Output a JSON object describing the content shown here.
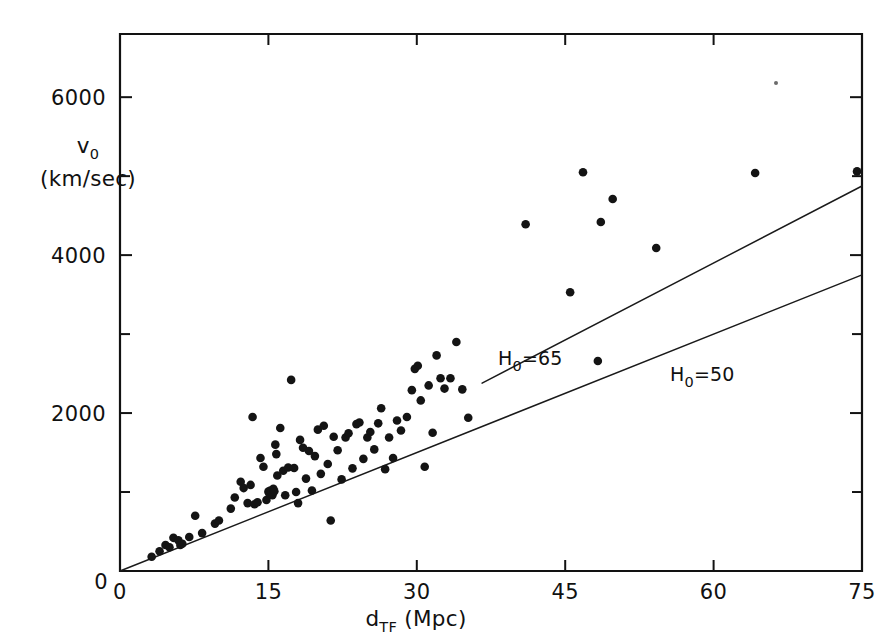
{
  "figure": {
    "name": "tully-fisher-hubble-diagram",
    "background_color": "#ffffff",
    "ink_color": "#121212"
  },
  "chart_data": {
    "type": "scatter",
    "title": "",
    "xlabel": "d_TF (Mpc)",
    "ylabel": "v_0 (km/sec)",
    "xlabel_parts": {
      "base": "d",
      "subscript": "TF",
      "unit": "(Mpc)"
    },
    "ylabel_parts": {
      "base": "v",
      "subscript": "0",
      "unit": "(km/sec)"
    },
    "xlim": [
      0,
      75
    ],
    "ylim": [
      0,
      6800
    ],
    "grid": false,
    "legend": "none",
    "x_ticks_major": [
      0,
      15,
      30,
      45,
      60,
      75
    ],
    "x_tick_labels": [
      "0",
      "15",
      "30",
      "45",
      "60",
      "75"
    ],
    "y_ticks_major": [
      0,
      2000,
      4000,
      6000
    ],
    "y_tick_labels": [
      "0",
      "2000",
      "4000",
      "6000"
    ],
    "y_ticks_minor": [
      1000,
      3000,
      5000
    ],
    "x_units": "Mpc",
    "y_units": "km/sec",
    "series": [
      {
        "name": "galaxies",
        "marker": "filled-circle",
        "color": "#141414",
        "points": [
          [
            3.2,
            180
          ],
          [
            4.0,
            250
          ],
          [
            4.6,
            330
          ],
          [
            5.0,
            300
          ],
          [
            5.4,
            420
          ],
          [
            5.9,
            390
          ],
          [
            6.1,
            330
          ],
          [
            6.3,
            345
          ],
          [
            7.0,
            430
          ],
          [
            7.6,
            700
          ],
          [
            8.3,
            480
          ],
          [
            9.6,
            600
          ],
          [
            10.0,
            640
          ],
          [
            11.2,
            790
          ],
          [
            11.6,
            930
          ],
          [
            12.2,
            1130
          ],
          [
            12.5,
            1050
          ],
          [
            12.9,
            860
          ],
          [
            13.2,
            1090
          ],
          [
            13.4,
            1950
          ],
          [
            13.6,
            845
          ],
          [
            13.9,
            870
          ],
          [
            14.2,
            1430
          ],
          [
            14.5,
            1320
          ],
          [
            14.8,
            900
          ],
          [
            15.0,
            1005
          ],
          [
            15.1,
            980
          ],
          [
            15.2,
            1020
          ],
          [
            15.3,
            1000
          ],
          [
            15.4,
            960
          ],
          [
            15.5,
            1040
          ],
          [
            15.6,
            1010
          ],
          [
            15.7,
            1600
          ],
          [
            15.8,
            1480
          ],
          [
            15.9,
            1210
          ],
          [
            16.2,
            1810
          ],
          [
            16.5,
            1270
          ],
          [
            16.7,
            960
          ],
          [
            17.0,
            1310
          ],
          [
            17.3,
            2420
          ],
          [
            17.6,
            1305
          ],
          [
            17.8,
            1000
          ],
          [
            18.0,
            860
          ],
          [
            18.2,
            1660
          ],
          [
            18.5,
            1560
          ],
          [
            18.8,
            1170
          ],
          [
            19.1,
            1520
          ],
          [
            19.4,
            1020
          ],
          [
            19.7,
            1455
          ],
          [
            20.0,
            1790
          ],
          [
            20.3,
            1230
          ],
          [
            20.6,
            1840
          ],
          [
            21.0,
            1355
          ],
          [
            21.3,
            640
          ],
          [
            21.6,
            1700
          ],
          [
            22.0,
            1530
          ],
          [
            22.4,
            1160
          ],
          [
            22.8,
            1690
          ],
          [
            23.1,
            1745
          ],
          [
            23.5,
            1300
          ],
          [
            23.9,
            1860
          ],
          [
            24.2,
            1880
          ],
          [
            24.6,
            1420
          ],
          [
            25.0,
            1690
          ],
          [
            25.3,
            1760
          ],
          [
            25.7,
            1540
          ],
          [
            26.1,
            1870
          ],
          [
            26.4,
            2060
          ],
          [
            26.8,
            1290
          ],
          [
            27.2,
            1690
          ],
          [
            27.6,
            1430
          ],
          [
            28.0,
            1905
          ],
          [
            28.4,
            1780
          ],
          [
            29.0,
            1950
          ],
          [
            29.5,
            2290
          ],
          [
            29.8,
            2560
          ],
          [
            30.1,
            2600
          ],
          [
            30.4,
            2160
          ],
          [
            30.8,
            1320
          ],
          [
            31.2,
            2350
          ],
          [
            31.6,
            1750
          ],
          [
            32.0,
            2730
          ],
          [
            32.4,
            2440
          ],
          [
            32.8,
            2310
          ],
          [
            33.4,
            2440
          ],
          [
            34.0,
            2900
          ],
          [
            34.6,
            2300
          ],
          [
            35.2,
            1940
          ],
          [
            41.0,
            4390
          ],
          [
            45.5,
            3530
          ],
          [
            46.8,
            5050
          ],
          [
            48.3,
            2660
          ],
          [
            48.6,
            4420
          ],
          [
            49.8,
            4710
          ],
          [
            54.2,
            4090
          ],
          [
            64.2,
            5040
          ],
          [
            74.5,
            5060
          ]
        ]
      }
    ],
    "reference_lines": [
      {
        "name": "H0-65",
        "label": "H₀=65",
        "label_parts": {
          "symbol": "H",
          "subscript": "0",
          "equals": "=",
          "value": "65"
        },
        "slope_km_s_per_Mpc": 65,
        "x_from": 36.6,
        "x_to": 75.0,
        "label_x_px": 498,
        "label_y_px": 365
      },
      {
        "name": "H0-50",
        "label": "H₀=50",
        "label_parts": {
          "symbol": "H",
          "subscript": "0",
          "equals": "=",
          "value": "50"
        },
        "slope_km_s_per_Mpc": 50,
        "x_from": 0.0,
        "x_to": 75.0,
        "label_x_px": 670,
        "label_y_px": 381
      }
    ],
    "artifacts": [
      {
        "name": "speck",
        "x_px": 776,
        "y_px": 83,
        "r_px": 2.0
      }
    ]
  },
  "axes": {
    "frame": {
      "left_px": 120,
      "right_px": 862,
      "top_px": 34,
      "bottom_px": 571
    },
    "x_axis_name": "x-axis-distance",
    "y_axis_name": "y-axis-velocity"
  }
}
